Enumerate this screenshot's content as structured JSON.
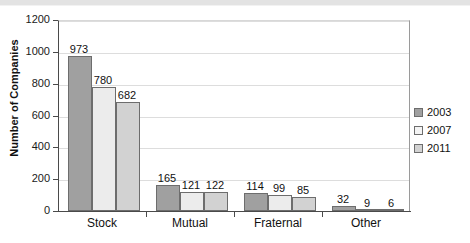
{
  "chart_data": {
    "type": "bar",
    "title": "",
    "subtitle": "",
    "xlabel": "",
    "ylabel": "Number of Companies",
    "categories": [
      "Stock",
      "Mutual",
      "Fraternal",
      "Other"
    ],
    "series": [
      {
        "name": "2003",
        "values": [
          973,
          165,
          114,
          32
        ],
        "color": "#a0a0a0"
      },
      {
        "name": "2007",
        "values": [
          780,
          121,
          99,
          9
        ],
        "color": "#ececec"
      },
      {
        "name": "2011",
        "values": [
          682,
          122,
          85,
          6
        ],
        "color": "#d2d2d2"
      }
    ],
    "ylim": [
      0,
      1200
    ],
    "yticks": [
      0,
      200,
      400,
      600,
      800,
      1000,
      1200
    ],
    "ytick_labels": [
      "0",
      "200",
      "400",
      "600",
      "800",
      "1000",
      "1200"
    ],
    "grid": "horizontal",
    "legend_position": "right",
    "data_labels": true
  },
  "legend": {
    "items": [
      {
        "label": "2003",
        "swatch": "legend-swatch-2003"
      },
      {
        "label": "2007",
        "swatch": "legend-swatch-2007"
      },
      {
        "label": "2011",
        "swatch": "legend-swatch-2011"
      }
    ]
  },
  "axis": {
    "y_title": "Number of Companies"
  }
}
